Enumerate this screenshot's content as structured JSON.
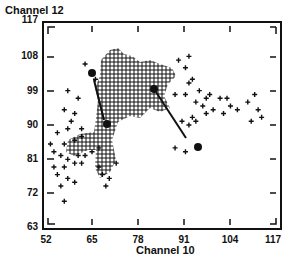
{
  "chart_data": {
    "type": "scatter",
    "title": "",
    "xlabel": "Channel 10",
    "ylabel": "Channel 12",
    "xlim": [
      52,
      117
    ],
    "ylim": [
      63,
      117
    ],
    "xticks": [
      "52",
      "65",
      "78",
      "91",
      "104",
      "117"
    ],
    "yticks": [
      "117",
      "108",
      "99",
      "90",
      "81",
      "72",
      "63"
    ],
    "grid": false,
    "legend": null,
    "series": [
      {
        "name": "pixels",
        "marker": "+",
        "description": "Dense cluster of '+' markers centered around Channel10 65-88, Channel12 85-110, with a sparser tail to the right (Channel10 88-115, Channel12 90-100) and lower-left (Channel10 54-68, Channel12 70-88)",
        "points": [
          [
            63,
            106
          ],
          [
            66,
            102
          ],
          [
            58,
            99
          ],
          [
            61,
            97
          ],
          [
            57,
            94
          ],
          [
            60,
            93
          ],
          [
            59,
            91
          ],
          [
            62,
            89
          ],
          [
            58,
            89
          ],
          [
            55,
            88
          ],
          [
            53,
            85
          ],
          [
            57,
            85
          ],
          [
            60,
            86
          ],
          [
            62,
            87
          ],
          [
            54,
            83
          ],
          [
            56,
            82
          ],
          [
            58,
            81
          ],
          [
            61,
            82
          ],
          [
            63,
            82
          ],
          [
            54,
            79
          ],
          [
            57,
            79
          ],
          [
            60,
            80
          ],
          [
            62,
            80
          ],
          [
            55,
            77
          ],
          [
            58,
            76
          ],
          [
            60,
            75
          ],
          [
            56,
            74
          ],
          [
            57,
            70
          ],
          [
            67,
            79
          ],
          [
            68,
            77
          ],
          [
            72,
            80
          ],
          [
            70,
            76
          ],
          [
            69,
            74
          ],
          [
            65,
            83
          ],
          [
            67,
            84
          ],
          [
            90,
            107
          ],
          [
            93,
            108
          ],
          [
            92,
            105
          ],
          [
            94,
            102
          ],
          [
            93,
            101
          ],
          [
            89,
            98
          ],
          [
            92,
            98
          ],
          [
            96,
            99
          ],
          [
            99,
            98
          ],
          [
            98,
            97
          ],
          [
            95,
            96
          ],
          [
            97,
            95
          ],
          [
            102,
            97
          ],
          [
            104,
            97
          ],
          [
            100,
            94
          ],
          [
            98,
            93
          ],
          [
            103,
            93
          ],
          [
            105,
            95
          ],
          [
            107,
            94
          ],
          [
            110,
            96
          ],
          [
            112,
            98
          ],
          [
            113,
            94
          ],
          [
            114,
            92
          ],
          [
            111,
            91
          ],
          [
            94,
            92
          ],
          [
            91,
            91
          ],
          [
            93,
            90
          ],
          [
            95,
            91
          ],
          [
            89,
            84
          ],
          [
            92,
            83
          ]
        ]
      },
      {
        "name": "dense-cluster",
        "marker": "+",
        "region": {
          "x": [
            65,
            90
          ],
          "y": [
            82,
            113
          ]
        }
      },
      {
        "name": "cluster-means",
        "marker": "filled-circle",
        "points": [
          [
            65,
            104
          ],
          [
            69,
            90
          ],
          [
            84,
            100
          ],
          [
            96,
            84
          ]
        ]
      }
    ],
    "annotations": [
      {
        "type": "arrow",
        "from": [
          65,
          104
        ],
        "to": [
          69,
          90
        ],
        "label": ""
      },
      {
        "type": "arrow",
        "from": [
          84,
          100
        ],
        "to": [
          96,
          84
        ],
        "label": ""
      }
    ]
  },
  "labels": {
    "ylabel": "Channel  12",
    "xlabel": "Channel  10"
  }
}
